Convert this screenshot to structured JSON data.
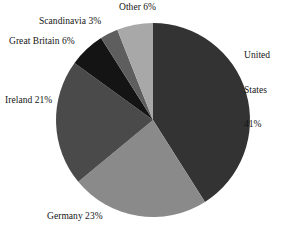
{
  "chart_data": {
    "type": "pie",
    "title": "",
    "subtitle": "",
    "xlabel": "",
    "ylabel": "",
    "legend_position": "none",
    "grid": false,
    "start_angle_deg": 0,
    "direction": "clockwise",
    "categories": [
      "United States",
      "Germany",
      "Ireland",
      "Great Britain",
      "Scandinavia",
      "Other"
    ],
    "values": [
      41,
      23,
      21,
      6,
      3,
      6
    ],
    "value_unit": "%",
    "labels": [
      "United States 41%",
      "Germany 23%",
      "Ireland 21%",
      "Great Britain 6%",
      "Scandinavia 3%",
      "Other 6%"
    ],
    "colors": [
      "#333333",
      "#8a8a8a",
      "#4a4a4a",
      "#141414",
      "#5e5e5e",
      "#a8a8a8"
    ],
    "slices": [
      {
        "name": "United States",
        "value": 41,
        "label": "United States 41%",
        "color": "#333333"
      },
      {
        "name": "Germany",
        "value": 23,
        "label": "Germany 23%",
        "color": "#8a8a8a"
      },
      {
        "name": "Ireland",
        "value": 21,
        "label": "Ireland 21%",
        "color": "#4a4a4a"
      },
      {
        "name": "Great Britain",
        "value": 6,
        "label": "Great Britain 6%",
        "color": "#141414"
      },
      {
        "name": "Scandinavia",
        "value": 3,
        "label": "Scandinavia 3%",
        "color": "#5e5e5e"
      },
      {
        "name": "Other",
        "value": 6,
        "label": "Other 6%",
        "color": "#a8a8a8"
      }
    ]
  },
  "labels": {
    "united_states_line1": "United",
    "united_states_line2": "States",
    "united_states_line3": "41%",
    "germany": "Germany 23%",
    "ireland": "Ireland 21%",
    "great_britain": "Great Britain 6%",
    "scandinavia": "Scandinavia 3%",
    "other": "Other 6%"
  }
}
